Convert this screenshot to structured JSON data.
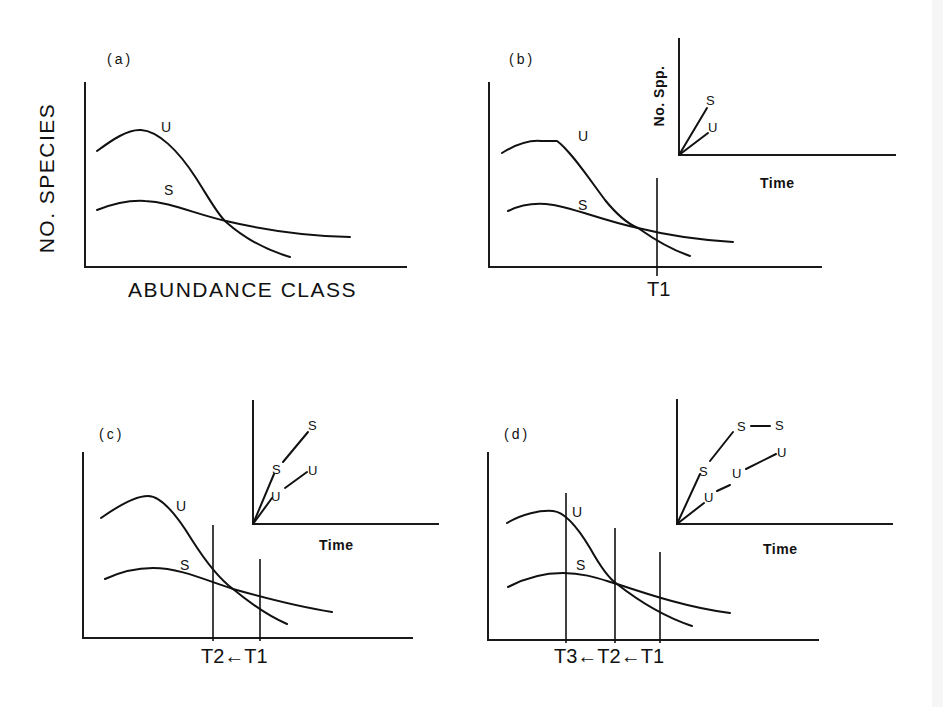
{
  "figure": {
    "colors": {
      "ink": "#111111",
      "background": "#ffffff",
      "edge_strip": "#f6f6f6"
    },
    "panels": [
      {
        "id": "a",
        "label": "(a)",
        "label_pos": [
          107,
          64
        ],
        "axes": {
          "origin": [
            85,
            267
          ],
          "top": 82,
          "right": 407
        },
        "y_axis_label": {
          "text": "NO. SPECIES",
          "center": [
            54,
            178
          ]
        },
        "x_axis_label": {
          "text": "ABUNDANCE CLASS",
          "pos": [
            128,
            297
          ]
        },
        "curves": [
          {
            "name": "U",
            "path": "M97,151 C112,140 128,129 141,130 C158,131 178,150 196,178 C210,200 218,215 226,222 C244,238 266,250 290,257",
            "label": "U",
            "label_pos": [
              161,
              132
            ]
          },
          {
            "name": "S",
            "path": "M97,210 C115,203 130,200 145,201 C170,202 195,214 226,221 C260,229 300,236 350,237",
            "label": "S",
            "label_pos": [
              164,
              195
            ]
          }
        ],
        "time_lines": [],
        "inset": null
      },
      {
        "id": "b",
        "label": "(b)",
        "label_pos": [
          509,
          64
        ],
        "axes": {
          "origin": [
            489,
            267
          ],
          "top": 82,
          "right": 822
        },
        "x_axis_label": {
          "text": "T1",
          "pos": [
            647,
            296
          ]
        },
        "curves": [
          {
            "name": "U",
            "path": "M502,153 C515,145 530,140 541,141 L557,141 C570,150 590,180 605,200 C618,216 628,224 638,228 C655,240 672,250 690,256",
            "label": "U",
            "label_pos": [
              578,
              141
            ]
          },
          {
            "name": "S",
            "path": "M508,211 C520,205 533,203 546,204 C570,206 600,220 638,228 C670,236 700,240 733,242",
            "label": "S",
            "label_pos": [
              578,
              210
            ]
          }
        ],
        "time_lines": [
          {
            "x": 657,
            "y1": 178,
            "y2": 276
          }
        ],
        "inset": {
          "axes": {
            "origin": [
              679,
              155
            ],
            "top": 38,
            "right": 896
          },
          "y_label": {
            "text": "No. Spp.",
            "center": [
              659,
              96
            ]
          },
          "x_label": {
            "text": "Time",
            "pos": [
              760,
              188
            ]
          },
          "segments": [
            {
              "series": "S",
              "from": [
                679,
                155
              ],
              "to": [
                707,
                108
              ]
            },
            {
              "series": "U",
              "from": [
                679,
                155
              ],
              "to": [
                708,
                133
              ]
            }
          ],
          "markers": [
            {
              "text": "S",
              "pos": [
                706,
                105
              ]
            },
            {
              "text": "U",
              "pos": [
                708,
                132
              ]
            }
          ]
        }
      },
      {
        "id": "c",
        "label": "(c)",
        "label_pos": [
          99,
          439
        ],
        "axes": {
          "origin": [
            83,
            638
          ],
          "top": 452,
          "right": 413
        },
        "x_axis_label": {
          "text": "T2←T1",
          "pos": [
            201,
            663
          ]
        },
        "curves": [
          {
            "name": "U",
            "path": "M101,518 C118,506 135,496 148,496 C160,496 175,512 192,540 C206,562 218,578 233,589 C250,603 268,616 287,624",
            "label": "U",
            "label_pos": [
              176,
              511
            ]
          },
          {
            "name": "S",
            "path": "M105,579 C120,572 137,568 153,568 C180,568 205,580 233,589 C265,598 300,607 332,612",
            "label": "S",
            "label_pos": [
              180,
              570
            ]
          }
        ],
        "time_lines": [
          {
            "x": 213,
            "y1": 525,
            "y2": 641
          },
          {
            "x": 260,
            "y1": 559,
            "y2": 641
          }
        ],
        "inset": {
          "axes": {
            "origin": [
              253,
              524
            ],
            "top": 400,
            "right": 439
          },
          "y_label": null,
          "x_label": {
            "text": "Time",
            "pos": [
              319,
              550
            ]
          },
          "segments": [
            {
              "series": "S",
              "from": [
                253,
                524
              ],
              "to": [
                274,
                474
              ]
            },
            {
              "series": "S",
              "from": [
                283,
                462
              ],
              "to": [
                308,
                432
              ]
            },
            {
              "series": "U",
              "from": [
                253,
                524
              ],
              "to": [
                272,
                498
              ]
            },
            {
              "series": "U",
              "from": [
                285,
                488
              ],
              "to": [
                307,
                472
              ]
            }
          ],
          "markers": [
            {
              "text": "S",
              "pos": [
                272,
                474
              ]
            },
            {
              "text": "S",
              "pos": [
                308,
                430
              ]
            },
            {
              "text": "U",
              "pos": [
                271,
                501
              ]
            },
            {
              "text": "U",
              "pos": [
                308,
                475
              ]
            }
          ]
        }
      },
      {
        "id": "d",
        "label": "(d)",
        "label_pos": [
          504,
          439
        ],
        "axes": {
          "origin": [
            488,
            640
          ],
          "top": 452,
          "right": 819
        },
        "x_axis_label": {
          "text": "T3←T2←T1",
          "pos": [
            554,
            663
          ]
        },
        "curves": [
          {
            "name": "U",
            "path": "M507,523 C522,514 540,510 553,511 C565,512 578,528 590,548 C600,566 608,578 617,584 C640,602 665,617 692,626",
            "label": "U",
            "label_pos": [
              572,
              517
            ]
          },
          {
            "name": "S",
            "path": "M508,587 C525,578 545,573 563,573 C585,573 600,579 617,584 C650,595 690,608 730,613",
            "label": "S",
            "label_pos": [
              576,
              570
            ]
          }
        ],
        "time_lines": [
          {
            "x": 566,
            "y1": 493,
            "y2": 643
          },
          {
            "x": 615,
            "y1": 528,
            "y2": 643
          },
          {
            "x": 660,
            "y1": 552,
            "y2": 643
          }
        ],
        "inset": {
          "axes": {
            "origin": [
              677,
              524
            ],
            "top": 399,
            "right": 893
          },
          "y_label": null,
          "x_label": {
            "text": "Time",
            "pos": [
              763,
              554
            ]
          },
          "segments": [
            {
              "series": "S",
              "from": [
                677,
                524
              ],
              "to": [
                700,
                474
              ]
            },
            {
              "series": "S",
              "from": [
                710,
                461
              ],
              "to": [
                733,
                432
              ]
            },
            {
              "series": "S",
              "from": [
                751,
                426
              ],
              "to": [
                770,
                426
              ]
            },
            {
              "series": "U",
              "from": [
                677,
                524
              ],
              "to": [
                704,
                503
              ]
            },
            {
              "series": "U",
              "from": [
                717,
                491
              ],
              "to": [
                730,
                485
              ]
            },
            {
              "series": "U",
              "from": [
                746,
                469
              ],
              "to": [
                776,
                454
              ]
            }
          ],
          "markers": [
            {
              "text": "S",
              "pos": [
                699,
                476
              ]
            },
            {
              "text": "S",
              "pos": [
                737,
                431
              ]
            },
            {
              "text": "S",
              "pos": [
                775,
                430
              ]
            },
            {
              "text": "U",
              "pos": [
                704,
                502
              ]
            },
            {
              "text": "U",
              "pos": [
                732,
                478
              ]
            },
            {
              "text": "U",
              "pos": [
                777,
                457
              ]
            }
          ]
        }
      }
    ]
  }
}
